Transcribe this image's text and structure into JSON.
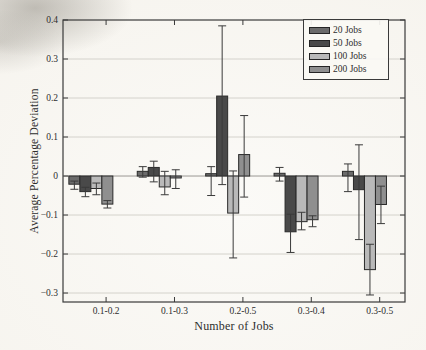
{
  "figure": {
    "background_color": "#f4f1ea",
    "frame_color": "#3a3a3a",
    "grid_color": "#d4d2cc",
    "zero_line_color": "#9a9894",
    "error_bar_color": "#3a3a3a",
    "bar_border_color": "#2a2a2a",
    "text_color": "#2e2e2e"
  },
  "chart_data": {
    "type": "bar",
    "title": "",
    "xlabel": "Number of Jobs",
    "ylabel": "Average Percentage Deviation",
    "categories": [
      "0.1-0.2",
      "0.1-0.3",
      "0.2-0.5",
      "0.3-0.4",
      "0.3-0.5"
    ],
    "y_tick_labels": [
      "0.4",
      "0.3",
      "0.2",
      "0.1",
      "0",
      "−0.1",
      "−0.2",
      "−0.3"
    ],
    "y_tick_values": [
      0.4,
      0.3,
      0.2,
      0.1,
      0,
      -0.1,
      -0.2,
      -0.3
    ],
    "ylim": [
      -0.323,
      0.4
    ],
    "grid": true,
    "legend_position": "top-right",
    "error_bars": true,
    "series": [
      {
        "name": "20 Jobs",
        "color": "#6b6b6b",
        "values": [
          -0.021,
          0.012,
          0.006,
          0.007,
          0.012
        ],
        "err_low": [
          -0.034,
          -0.003,
          -0.05,
          -0.013,
          -0.04
        ],
        "err_high": [
          -0.013,
          0.024,
          0.024,
          0.022,
          0.031
        ]
      },
      {
        "name": "50 Jobs",
        "color": "#494949",
        "values": [
          -0.04,
          0.022,
          0.205,
          -0.143,
          -0.035
        ],
        "err_low": [
          -0.053,
          -0.015,
          -0.022,
          -0.196,
          -0.163
        ],
        "err_high": [
          -0.029,
          0.038,
          0.385,
          -0.098,
          0.08
        ]
      },
      {
        "name": "100 Jobs",
        "color": "#b9b9b9",
        "values": [
          -0.032,
          -0.028,
          -0.095,
          -0.117,
          -0.24
        ],
        "err_low": [
          -0.048,
          -0.048,
          -0.21,
          -0.138,
          -0.305
        ],
        "err_high": [
          -0.018,
          0.012,
          0.013,
          -0.093,
          -0.175
        ]
      },
      {
        "name": "200 Jobs",
        "color": "#8f8f8f",
        "values": [
          -0.072,
          -0.005,
          0.055,
          -0.112,
          -0.073
        ],
        "err_low": [
          -0.082,
          -0.032,
          -0.054,
          -0.13,
          -0.122
        ],
        "err_high": [
          -0.063,
          0.016,
          0.155,
          -0.102,
          -0.026
        ]
      }
    ]
  }
}
